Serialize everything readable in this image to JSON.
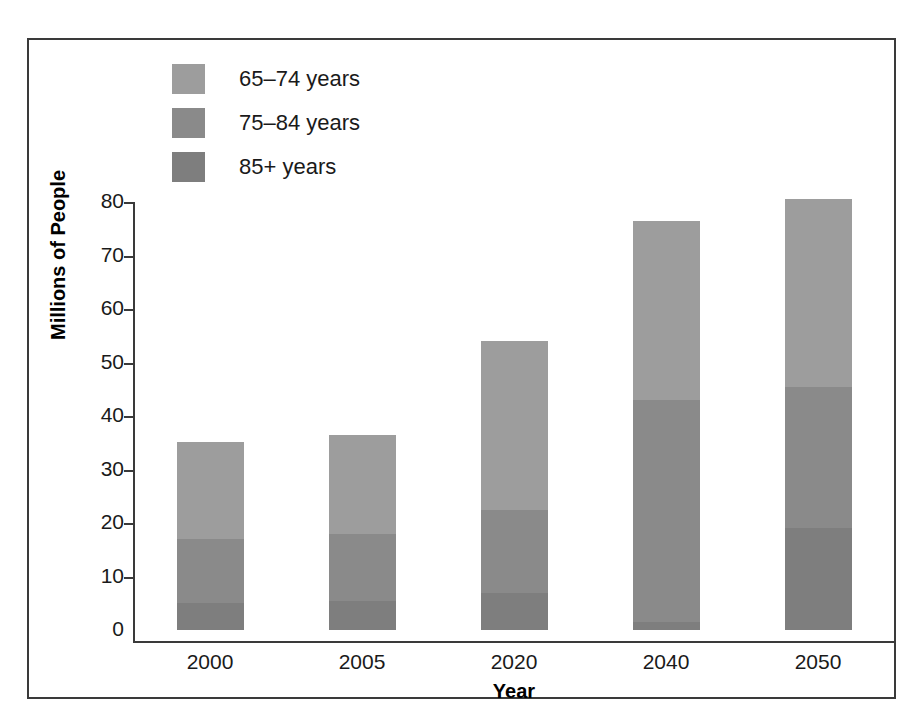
{
  "chart_data": {
    "type": "bar",
    "subtype": "stacked-vertical",
    "title": "",
    "xlabel": "Year",
    "ylabel": "Millions of People",
    "categories": [
      "2000",
      "2005",
      "2020",
      "2040",
      "2050"
    ],
    "series": [
      {
        "name": "65–74 years",
        "color": "#9d9d9d",
        "values": [
          18.2,
          18.5,
          31.5,
          33.5,
          35.0
        ]
      },
      {
        "name": "75–84 years",
        "color": "#8a8a8a",
        "values": [
          12.0,
          12.5,
          15.5,
          41.5,
          26.5
        ]
      },
      {
        "name": "85+ years",
        "color": "#7e7e7e",
        "values": [
          5.0,
          5.5,
          7.0,
          1.5,
          19.0
        ]
      }
    ],
    "totals": [
      35.2,
      36.5,
      54.0,
      76.5,
      80.5
    ],
    "ylim": [
      0,
      80
    ],
    "yticks": [
      0,
      10,
      20,
      30,
      40,
      50,
      60,
      70,
      80
    ],
    "ytick_labels": [
      "0",
      "10",
      "20",
      "30",
      "40",
      "50",
      "60",
      "70",
      "80"
    ],
    "grid": false,
    "legend_position": "top-left",
    "frame": true
  },
  "axes": {
    "y_title": "Millions of People",
    "x_title": "Year"
  },
  "legend": {
    "items": [
      {
        "label": "65–74 years",
        "color": "#9d9d9d"
      },
      {
        "label": "75–84 years",
        "color": "#8a8a8a"
      },
      {
        "label": "85+ years",
        "color": "#7e7e7e"
      }
    ]
  },
  "colors": {
    "band_65_74": "#9d9d9d",
    "band_75_84": "#8a8a8a",
    "band_85_plus": "#7e7e7e",
    "axis": "#3a3a3a",
    "text": "#1a1a1a",
    "background": "#ffffff"
  }
}
